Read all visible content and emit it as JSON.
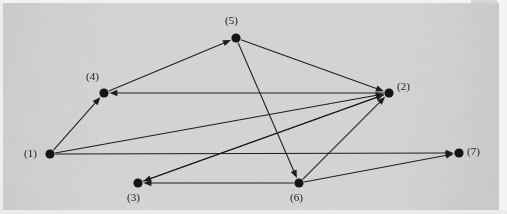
{
  "figure": {
    "type": "directed-graph",
    "width": 507,
    "height": 214,
    "background_color": "#d6d4d2",
    "ink_color": "#1a1a1a",
    "node_color": "#111111"
  },
  "chart_data": {
    "type": "diagram",
    "subtype": "directed-graph",
    "title": "",
    "xlabel": "",
    "ylabel": "",
    "grid": false,
    "legend": "none",
    "directed": true,
    "node_count": 7,
    "edge_count": 12,
    "nodes": [
      {
        "id": 1,
        "label": "(1)",
        "x": 50,
        "y": 154,
        "label_x": 24,
        "label_y": 147,
        "label_side": "left"
      },
      {
        "id": 2,
        "label": "(2)",
        "x": 389,
        "y": 93,
        "label_x": 397,
        "label_y": 80,
        "label_side": "right"
      },
      {
        "id": 3,
        "label": "(3)",
        "x": 138,
        "y": 183,
        "label_x": 127,
        "label_y": 191,
        "label_side": "below"
      },
      {
        "id": 4,
        "label": "(4)",
        "x": 104,
        "y": 93,
        "label_x": 86,
        "label_y": 70,
        "label_side": "above-left"
      },
      {
        "id": 5,
        "label": "(5)",
        "x": 236,
        "y": 38,
        "label_x": 225,
        "label_y": 14,
        "label_side": "above"
      },
      {
        "id": 6,
        "label": "(6)",
        "x": 299,
        "y": 183,
        "label_x": 290,
        "label_y": 191,
        "label_side": "below"
      },
      {
        "id": 7,
        "label": "(7)",
        "x": 459,
        "y": 153,
        "label_x": 467,
        "label_y": 145,
        "label_side": "right"
      }
    ],
    "edges": [
      {
        "from": 1,
        "to": 4,
        "directed": true
      },
      {
        "from": 1,
        "to": 2,
        "directed": true
      },
      {
        "from": 1,
        "to": 7,
        "directed": true
      },
      {
        "from": 4,
        "to": 5,
        "directed": true
      },
      {
        "from": 5,
        "to": 2,
        "directed": true
      },
      {
        "from": 5,
        "to": 6,
        "directed": true
      },
      {
        "from": 2,
        "to": 4,
        "directed": true
      },
      {
        "from": 2,
        "to": 3,
        "directed": true
      },
      {
        "from": 3,
        "to": 2,
        "directed": true
      },
      {
        "from": 6,
        "to": 2,
        "directed": true
      },
      {
        "from": 6,
        "to": 3,
        "directed": true
      },
      {
        "from": 6,
        "to": 7,
        "directed": true
      }
    ],
    "node_radius": 4.6,
    "arrow_length": 8,
    "arrow_width": 3.2
  }
}
